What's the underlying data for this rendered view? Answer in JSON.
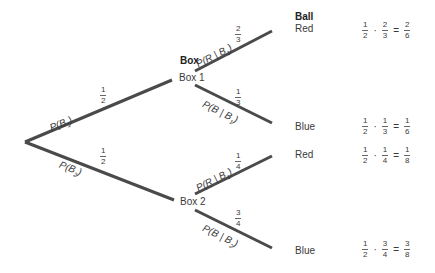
{
  "headers": {
    "box": "Box",
    "ball": "Ball"
  },
  "nodes": {
    "box1": "Box 1",
    "box2": "Box 2",
    "red1": "Red",
    "blue1": "Blue",
    "red2": "Red",
    "blue2": "Blue"
  },
  "branches": {
    "b1": {
      "label_prefix": "P(B",
      "label_sub": "1",
      "label_suffix": ")",
      "num": "1",
      "den": "2"
    },
    "b2": {
      "label_prefix": "P(B",
      "label_sub": "2",
      "label_suffix": ")",
      "num": "1",
      "den": "2"
    },
    "r1": {
      "label_prefix": "P(R | B",
      "label_sub": "1",
      "label_suffix": ")",
      "num": "2",
      "den": "3"
    },
    "bl1": {
      "label_prefix": "P(B | B",
      "label_sub": "1",
      "label_suffix": ")",
      "num": "1",
      "den": "3"
    },
    "r2": {
      "label_prefix": "P(R | B",
      "label_sub": "1",
      "label_suffix": ")",
      "num": "1",
      "den": "4"
    },
    "bl2": {
      "label_prefix": "P(B | B",
      "label_sub": "2",
      "label_suffix": ")",
      "num": "3",
      "den": "4"
    }
  },
  "products": [
    {
      "a_num": "1",
      "a_den": "2",
      "b_num": "2",
      "b_den": "3",
      "r_num": "2",
      "r_den": "6",
      "dot": "·",
      "eq": "="
    },
    {
      "a_num": "1",
      "a_den": "2",
      "b_num": "1",
      "b_den": "3",
      "r_num": "1",
      "r_den": "6",
      "dot": "·",
      "eq": "="
    },
    {
      "a_num": "1",
      "a_den": "2",
      "b_num": "1",
      "b_den": "4",
      "r_num": "1",
      "r_den": "8",
      "dot": "·",
      "eq": "="
    },
    {
      "a_num": "1",
      "a_den": "2",
      "b_num": "3",
      "b_den": "4",
      "r_num": "3",
      "r_den": "8",
      "dot": "·",
      "eq": "="
    }
  ],
  "colors": {
    "line": "#4a4a4a",
    "text": "#3a3a3a"
  }
}
